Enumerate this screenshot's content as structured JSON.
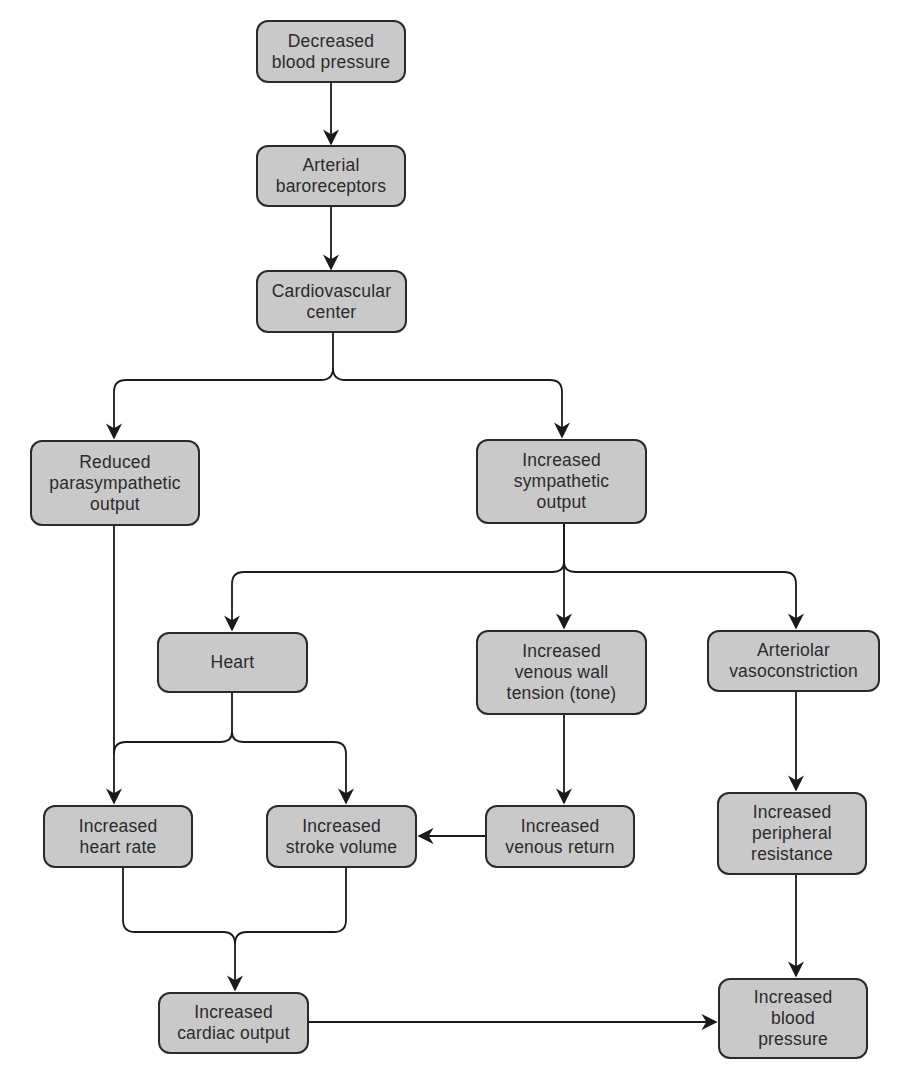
{
  "diagram": {
    "colors": {
      "node_fill": "#c9c9c9",
      "node_border": "#2a2a2a",
      "text": "#2b2b2b",
      "line": "#1a1a1a"
    },
    "nodes": {
      "decreased_bp": "Decreased\nblood pressure",
      "baroreceptors": "Arterial\nbaroreceptors",
      "cv_center": "Cardiovascular\ncenter",
      "reduced_parasym": "Reduced\nparasympathetic\noutput",
      "increased_sym": "Increased\nsympathetic\noutput",
      "heart": "Heart",
      "venous_tone": "Increased\nvenous wall\ntension (tone)",
      "arteriolar": "Arteriolar\nvasoconstriction",
      "heart_rate": "Increased\nheart rate",
      "stroke_volume": "Increased\nstroke volume",
      "venous_return": "Increased\nvenous return",
      "peripheral_resistance": "Increased\nperipheral\nresistance",
      "cardiac_output": "Increased\ncardiac output",
      "increased_bp": "Increased\nblood\npressure"
    },
    "edges": [
      [
        "decreased_bp",
        "baroreceptors"
      ],
      [
        "baroreceptors",
        "cv_center"
      ],
      [
        "cv_center",
        "reduced_parasym"
      ],
      [
        "cv_center",
        "increased_sym"
      ],
      [
        "increased_sym",
        "heart"
      ],
      [
        "increased_sym",
        "venous_tone"
      ],
      [
        "increased_sym",
        "arteriolar"
      ],
      [
        "reduced_parasym",
        "heart_rate"
      ],
      [
        "heart",
        "heart_rate"
      ],
      [
        "heart",
        "stroke_volume"
      ],
      [
        "venous_tone",
        "venous_return"
      ],
      [
        "venous_return",
        "stroke_volume"
      ],
      [
        "arteriolar",
        "peripheral_resistance"
      ],
      [
        "heart_rate",
        "cardiac_output"
      ],
      [
        "stroke_volume",
        "cardiac_output"
      ],
      [
        "cardiac_output",
        "increased_bp"
      ],
      [
        "peripheral_resistance",
        "increased_bp"
      ]
    ]
  }
}
